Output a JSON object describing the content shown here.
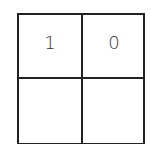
{
  "grid": {
    "rows": 2,
    "cols": 2,
    "cells": [
      [
        "1",
        "0"
      ],
      [
        "",
        ""
      ]
    ]
  }
}
